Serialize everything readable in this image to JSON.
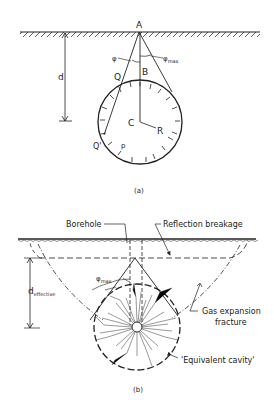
{
  "figure_a": {
    "caption": "(a)",
    "labels": {
      "apex": "A",
      "top_of_cavity": "B",
      "center": "C",
      "radius": "R",
      "tangent_point_upper": "Q",
      "tangent_point_lower": "Q'",
      "pressure": "p",
      "depth": "d",
      "angle": "φ",
      "angle_max": "φ",
      "angle_max_sub": "max"
    }
  },
  "figure_b": {
    "caption": "(b)",
    "labels": {
      "borehole": "Borehole",
      "reflection_breakage": "Reflection  breakage",
      "depth": "d",
      "depth_sub": "effective",
      "angle_max": "φ",
      "angle_max_sub": "max",
      "gas_expansion_line1": "Gas  expansion",
      "gas_expansion_line2": "fracture",
      "equivalent_cavity": "'Equivalent  cavity'"
    }
  }
}
